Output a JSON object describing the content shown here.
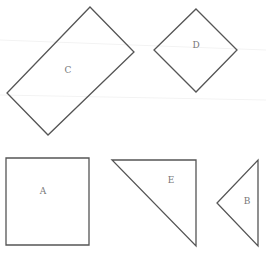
{
  "diagram": {
    "shapes": [
      {
        "id": "C",
        "label": "C",
        "type": "rotated-rectangle",
        "points": "90,7 134,52 48,135 7,93",
        "label_pos": [
          68,
          70
        ]
      },
      {
        "id": "D",
        "label": "D",
        "type": "diamond",
        "points": "196,9 237,50 196,92 154,50",
        "label_pos": [
          196,
          45
        ]
      },
      {
        "id": "A",
        "label": "A",
        "type": "square",
        "points": "6,158 89,158 89,245 6,245",
        "label_pos": [
          43,
          191
        ]
      },
      {
        "id": "E",
        "label": "E",
        "type": "right-triangle",
        "points": "112,160 196,160 196,246",
        "label_pos": [
          171,
          180
        ]
      },
      {
        "id": "B",
        "label": "B",
        "type": "triangle",
        "points": "258,160 258,246 217,203",
        "label_pos": [
          247,
          201
        ]
      }
    ],
    "stroke_color": "#555555",
    "label_color": "#777777"
  }
}
